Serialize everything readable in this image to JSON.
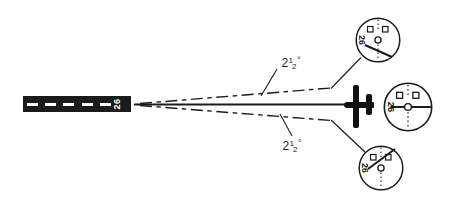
{
  "scene": {
    "background_color": "#ffffff",
    "ink_color": "#1b1b1b"
  },
  "runway": {
    "number": "26",
    "centerline_dash_count": 5
  },
  "beam": {
    "upper_angle": {
      "whole": "2",
      "num": "1",
      "den": "2",
      "deg": "°"
    },
    "lower_angle": {
      "whole": "2",
      "num": "1",
      "den": "2",
      "deg": "°"
    }
  },
  "indicators": {
    "top": {
      "course": "26",
      "needle": "deflected-down-right"
    },
    "middle": {
      "course": "26",
      "needle": "centered-horizontal"
    },
    "bottom": {
      "course": "26",
      "needle": "deflected-up-right"
    }
  }
}
